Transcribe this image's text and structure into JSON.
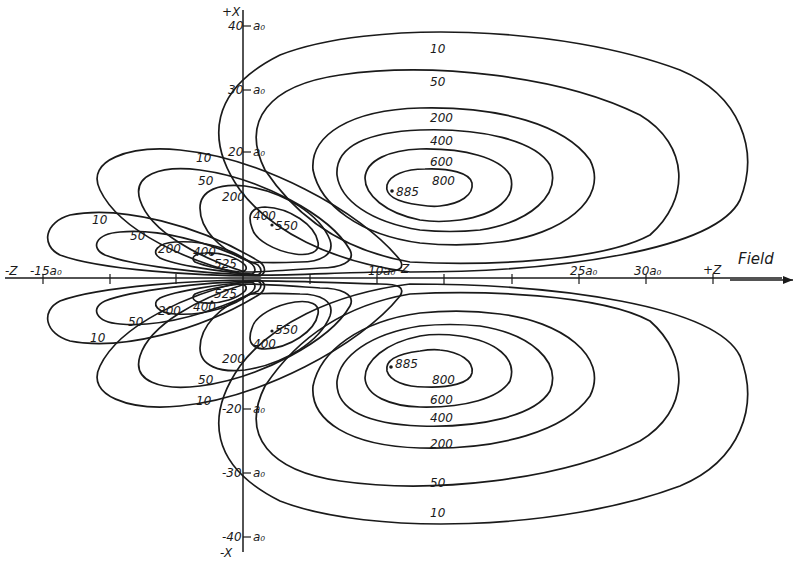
{
  "figure": {
    "type": "contour-diagram",
    "axes": {
      "x_axis": {
        "positive_label": "+Z",
        "negative_label": "-Z",
        "field_label": "Field"
      },
      "y_axis": {
        "positive_label": "+X",
        "negative_label": "-X"
      },
      "x_ticks": [
        "-15a₀",
        "10a₀",
        "25a₀",
        "30a₀"
      ],
      "y_ticks": [
        "40",
        "30",
        "20",
        "-20",
        "-30",
        "-40"
      ],
      "y_unit": "a₀",
      "nucleus_marker": "Z"
    },
    "contour_levels": [
      "10",
      "50",
      "200",
      "400",
      "600",
      "800"
    ],
    "upper_right_lobe": {
      "levels": [
        "10",
        "50",
        "200",
        "400",
        "600",
        "800"
      ],
      "peak": "885"
    },
    "lower_right_lobe": {
      "levels": [
        "10",
        "50",
        "200",
        "400",
        "600",
        "800"
      ],
      "peak": "885"
    },
    "upper_middle_lobe": {
      "levels": [
        "10",
        "50",
        "200",
        "400"
      ],
      "peak": "550"
    },
    "lower_middle_lobe": {
      "levels": [
        "10",
        "50",
        "200",
        "400"
      ],
      "peak": "550"
    },
    "upper_left_lobe": {
      "levels": [
        "10",
        "50",
        "200",
        "400"
      ],
      "peak": "525"
    },
    "lower_left_lobe": {
      "levels": [
        "10",
        "50",
        "200",
        "400"
      ],
      "peak": "525"
    }
  }
}
